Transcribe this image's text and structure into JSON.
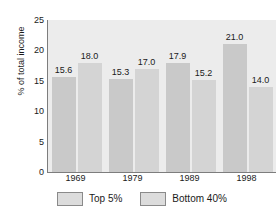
{
  "chart_data": {
    "type": "bar",
    "title": "",
    "subtitle": "",
    "xlabel": "",
    "ylabel": "% of total income",
    "categories": [
      "1969",
      "1979",
      "1989",
      "1998"
    ],
    "series": [
      {
        "name": "Top 5%",
        "values": [
          15.6,
          15.3,
          17.9,
          21.0
        ],
        "color": "#c9c9c9"
      },
      {
        "name": "Bottom 40%",
        "values": [
          18.0,
          17.0,
          15.2,
          14.0
        ],
        "color": "#d4d4d4"
      }
    ],
    "value_labels": [
      "15.6",
      "18.0",
      "15.3",
      "17.0",
      "17.9",
      "15.2",
      "21.0",
      "14.0"
    ],
    "ylim": [
      0,
      25
    ],
    "yticks": [
      0,
      5,
      10,
      15,
      20,
      25
    ],
    "ytick_labels": [
      "0",
      "5",
      "10",
      "15",
      "20",
      "25"
    ],
    "grid": false,
    "legend_position": "bottom",
    "plot_background": "#ececec",
    "axis_color": "#7d7d7d",
    "text_color": "#1a1a1a"
  }
}
